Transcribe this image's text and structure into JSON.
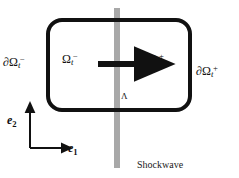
{
  "figure": {
    "width": 239,
    "height": 178,
    "background": "#ffffff"
  },
  "colors": {
    "outline": "#111111",
    "shockwave_band": "#a8a8a8",
    "arrow": "#111111",
    "axes": "#111111",
    "text": "#111111"
  },
  "control_volume": {
    "shape": "rounded-rectangle",
    "x": 48,
    "y": 20,
    "width": 142,
    "height": 90,
    "corner_radius": 14,
    "stroke_width": 4
  },
  "shockwave": {
    "label": "Shockwave",
    "band_x": 114,
    "band_y": 8,
    "band_width": 6,
    "band_height": 160,
    "orientation": "vertical"
  },
  "flow_arrow": {
    "name": "flow-direction-arrow",
    "x1": 98,
    "y1": 64,
    "x2": 142,
    "y2": 64,
    "direction": "rightward"
  },
  "labels": {
    "boundary_minus": {
      "base": "∂Ω",
      "sub": "t",
      "sup": "−"
    },
    "boundary_plus": {
      "base": "∂Ω",
      "sub": "t",
      "sup": "+"
    },
    "region_minus": {
      "base": "Ω",
      "sub": "t",
      "sup": "−"
    },
    "region_plus": {
      "base": "Ω",
      "sub": "t",
      "sup": "+"
    },
    "interface": "Λ"
  },
  "axes": {
    "origin_x": 30,
    "origin_y": 148,
    "vertical_tip_y": 107,
    "horizontal_tip_x": 67,
    "e1": {
      "base": "e",
      "sub": "1"
    },
    "e2": {
      "base": "e",
      "sub": "2"
    }
  }
}
